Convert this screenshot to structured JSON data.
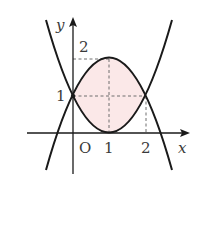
{
  "figure": {
    "colors": {
      "curve": "#1a1a1a",
      "axis": "#1a1a1a",
      "dash": "#6e6e6e",
      "fill": "#fbe8e8",
      "text": "#3a3a3a"
    },
    "axes": {
      "x_label": "x",
      "y_label": "y",
      "origin_label": "O"
    },
    "ticks": {
      "x": [
        "1",
        "2"
      ],
      "y": [
        "1",
        "2"
      ]
    },
    "curves": [
      {
        "name": "upper-parabola",
        "equation": "y = -(x-1)^2 + 2",
        "vertex": [
          1,
          2
        ]
      },
      {
        "name": "lower-parabola",
        "equation": "y = (x-1)^2",
        "vertex": [
          1,
          0
        ]
      }
    ],
    "intersections": [
      [
        0,
        1
      ],
      [
        2,
        1
      ]
    ],
    "shaded_region": "between curves for 0 ≤ x ≤ 2"
  }
}
